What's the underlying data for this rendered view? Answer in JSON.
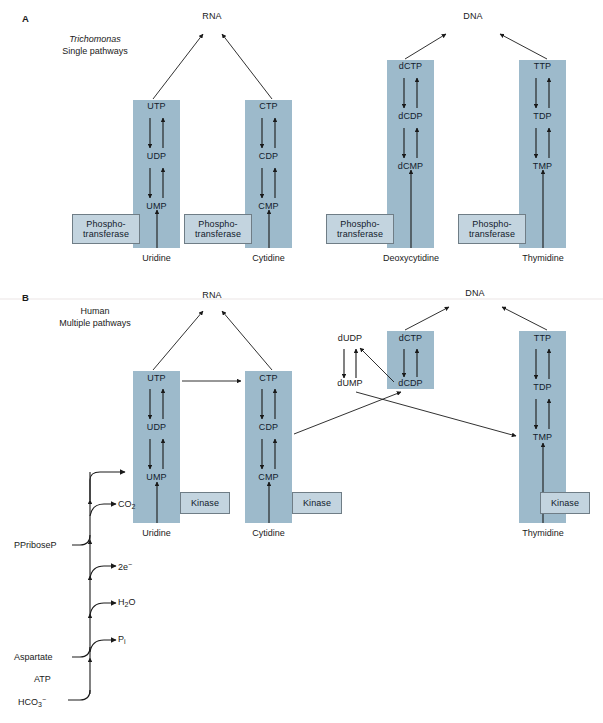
{
  "figure": {
    "background": "#ffffff",
    "column_color": "#9dbacb",
    "enzyme_box_color": "#c3d4df",
    "enzyme_box_border": "#6f7d86",
    "arrow_color": "#1a1a1a"
  },
  "panelA": {
    "letter": "A",
    "caption_line1": "Trichomonas",
    "caption_line2": "Single pathways",
    "targets": {
      "rna": "RNA",
      "dna": "DNA"
    },
    "columns": [
      {
        "id": "uridine",
        "nodes": [
          "UTP",
          "UDP",
          "UMP"
        ],
        "base": "Uridine",
        "enzyme": "Phospho-\ntransferase",
        "enzyme_line1": "Phospho-",
        "enzyme_line2": "transferase",
        "target": "RNA"
      },
      {
        "id": "cytidine",
        "nodes": [
          "CTP",
          "CDP",
          "CMP"
        ],
        "base": "Cytidine",
        "enzyme_line1": "Phospho-",
        "enzyme_line2": "transferase",
        "target": "RNA"
      },
      {
        "id": "deoxycytidine",
        "nodes": [
          "dCTP",
          "dCDP",
          "dCMP"
        ],
        "base": "Deoxycytidine",
        "enzyme_line1": "Phospho-",
        "enzyme_line2": "transferase",
        "target": "DNA"
      },
      {
        "id": "thymidine",
        "nodes": [
          "TTP",
          "TDP",
          "TMP"
        ],
        "base": "Thymidine",
        "enzyme_line1": "Phospho-",
        "enzyme_line2": "transferase",
        "target": "DNA"
      }
    ]
  },
  "panelB": {
    "letter": "B",
    "caption_line1": "Human",
    "caption_line2": "Multiple pathways",
    "targets": {
      "rna": "RNA",
      "dna": "DNA"
    },
    "columns": [
      {
        "id": "uridine",
        "nodes": [
          "UTP",
          "UDP",
          "UMP"
        ],
        "base": "Uridine",
        "enzyme": "Kinase",
        "target": "RNA"
      },
      {
        "id": "cytidine",
        "nodes": [
          "CTP",
          "CDP",
          "CMP"
        ],
        "base": "Cytidine",
        "enzyme": "Kinase",
        "target": "RNA"
      },
      {
        "id": "deoxycytidine",
        "nodes": [
          "dCTP",
          "dCDP"
        ],
        "target": "DNA"
      },
      {
        "id": "thymidine",
        "nodes": [
          "TTP",
          "TDP",
          "TMP"
        ],
        "base": "Thymidine",
        "enzyme": "Kinase",
        "target": "DNA"
      }
    ],
    "free_nodes": [
      "dUDP",
      "dUMP"
    ],
    "denovo": {
      "inputs": [
        "PPriboseP",
        "Aspartate",
        "ATP",
        "HCO3-"
      ],
      "outputs": [
        "CO2",
        "2e-",
        "H2O",
        "Pi"
      ],
      "labels": {
        "co2": "CO2",
        "electrons": "2e",
        "water": "H2O",
        "phosphate": "P",
        "phosphate_sub": "i",
        "ppriboseP": "PPriboseP",
        "aspartate": "Aspartate",
        "atp": "ATP",
        "bicarbonate": "HCO",
        "bicarbonate_sub": "3",
        "bicarbonate_sup": "−"
      },
      "terminus": "UMP"
    },
    "cross_edges": [
      {
        "from": "UTP",
        "to": "CTP"
      },
      {
        "from": "CDP",
        "to": "dCDP"
      },
      {
        "from": "dUMP",
        "to": "TMP"
      },
      {
        "from": "dCDP",
        "to": "dUDP"
      }
    ]
  }
}
